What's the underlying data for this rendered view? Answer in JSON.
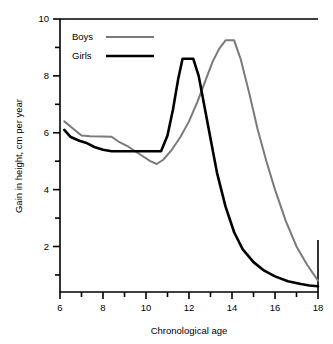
{
  "chart_data": {
    "type": "line",
    "title": "",
    "subtitle": "",
    "xlabel": "Chronological age",
    "ylabel": "Gain in height, cm  per year",
    "xlim": [
      6,
      18
    ],
    "ylim": [
      0.4,
      10
    ],
    "xticks": [
      6,
      7,
      8,
      9,
      10,
      11,
      12,
      13,
      14,
      15,
      16,
      17,
      18
    ],
    "xtick_labels": [
      "6",
      "",
      "8",
      "",
      "10",
      "",
      "12",
      "",
      "14",
      "",
      "16",
      "",
      "18"
    ],
    "yticks": [
      1,
      2,
      3,
      4,
      5,
      6,
      7,
      8,
      9,
      10
    ],
    "ytick_labels": [
      "",
      "2",
      "",
      "4",
      "",
      "6",
      "",
      "8",
      "",
      "10"
    ],
    "grid": false,
    "legend_position": "top-left",
    "series": [
      {
        "name": "Boys",
        "color": "#7a7a7a",
        "line_width": 2.0,
        "x": [
          6.2,
          6.6,
          7.0,
          7.4,
          8.0,
          8.4,
          8.7,
          9.2,
          9.8,
          10.2,
          10.5,
          10.8,
          11.2,
          11.6,
          12.0,
          12.4,
          12.8,
          13.1,
          13.4,
          13.7,
          14.1,
          14.4,
          14.8,
          15.2,
          15.6,
          16.0,
          16.5,
          17.0,
          17.5,
          18.0
        ],
        "y": [
          6.4,
          6.15,
          5.9,
          5.88,
          5.87,
          5.86,
          5.7,
          5.5,
          5.2,
          5.0,
          4.9,
          5.05,
          5.4,
          5.85,
          6.4,
          7.1,
          7.9,
          8.5,
          8.95,
          9.25,
          9.25,
          8.6,
          7.4,
          6.1,
          5.0,
          4.0,
          2.9,
          2.0,
          1.35,
          0.8
        ]
      },
      {
        "name": "Girls",
        "color": "#000000",
        "line_width": 2.6,
        "x": [
          6.2,
          6.5,
          6.9,
          7.2,
          7.6,
          8.0,
          8.4,
          9.0,
          9.6,
          10.2,
          10.7,
          11.0,
          11.25,
          11.5,
          11.7,
          12.2,
          12.45,
          12.7,
          13.0,
          13.3,
          13.7,
          14.1,
          14.5,
          15.0,
          15.5,
          16.0,
          16.6,
          17.2,
          17.6,
          18.0
        ],
        "y": [
          6.1,
          5.85,
          5.72,
          5.65,
          5.5,
          5.4,
          5.35,
          5.35,
          5.35,
          5.35,
          5.35,
          5.9,
          6.8,
          7.9,
          8.6,
          8.6,
          8.0,
          7.0,
          5.8,
          4.6,
          3.4,
          2.5,
          1.9,
          1.45,
          1.15,
          0.95,
          0.78,
          0.68,
          0.63,
          0.6
        ]
      }
    ],
    "legend": [
      {
        "label": "Boys",
        "color": "#7a7a7a"
      },
      {
        "label": "Girls",
        "color": "#000000"
      }
    ]
  }
}
